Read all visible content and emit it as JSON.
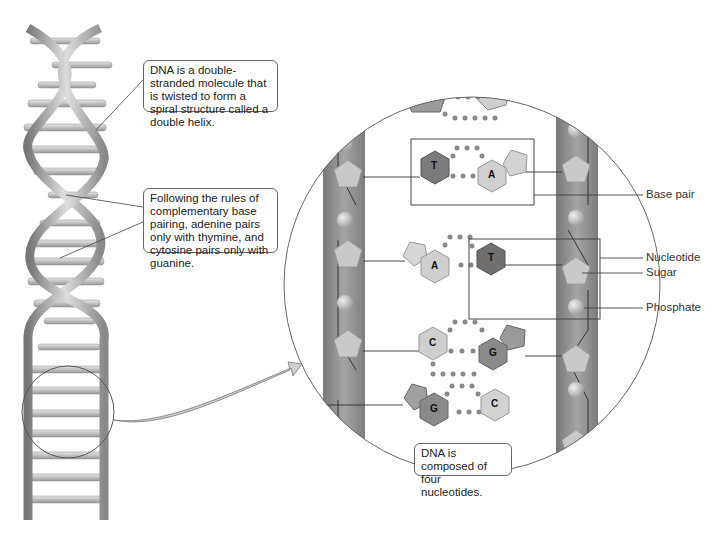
{
  "callouts": {
    "double_helix": "DNA is a double-stranded molecule that is twisted to form a spiral structure called a double helix.",
    "pairing_rules": "Following the rules of complementary base pairing, adenine pairs only with thymine, and cytosine pairs only with guanine.",
    "composition": "DNA is composed of four nucleotides."
  },
  "labels": {
    "base_pair": "Base pair",
    "nucleotide": "Nucleotide",
    "sugar": "Sugar",
    "phosphate": "Phosphate"
  },
  "bases": {
    "row1_left": "T",
    "row1_right": "A",
    "row2_left": "A",
    "row2_right": "T",
    "row3_left": "C",
    "row3_right": "G",
    "row4_left": "G",
    "row4_right": "C"
  },
  "colors": {
    "backbone": "#8a8a8a",
    "sugar": "#c8c8c8",
    "base_dark": "#7a7a7a",
    "base_light": "#cfcfcf",
    "outline": "#555555"
  }
}
